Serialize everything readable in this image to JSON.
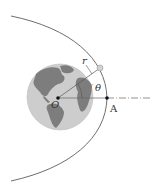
{
  "diagram": {
    "labels": {
      "r": "r",
      "theta": "θ",
      "O": "O",
      "A": "A"
    },
    "colors": {
      "orbit": "#6e6e6e",
      "earth_ocean": "#c9c9c9",
      "earth_land": "#7a7a7a",
      "satellite": "#cfcfcf",
      "axis": "#555555",
      "points": "#111111"
    },
    "geometry": {
      "focus_O": [
        58,
        98
      ],
      "vertex_A": [
        107,
        98
      ],
      "satellite": [
        100,
        68
      ],
      "earth_center": [
        60,
        97
      ],
      "earth_radius": 33
    }
  }
}
